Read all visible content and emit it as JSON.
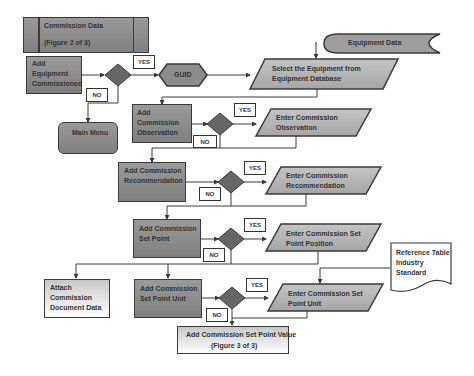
{
  "header": {
    "title": "Commission Data",
    "subtitle": "(Figure 2 of 3)"
  },
  "nodes": {
    "add_equipment": "Add\nEquipment\nCommissioned",
    "guid": "GUID",
    "equipment_data": "Equipment Data",
    "select_equipment": "Select the Equipment from\nEquipment Database",
    "main_menu": "Main Menu",
    "add_observation": "Add\nCommission\nObservation",
    "enter_observation": "Enter Commission\nObservation",
    "add_recommendation": "Add Commission\nRecommendation",
    "enter_recommendation": "Enter Commission\nRecommendation",
    "add_set_point": "Add Commission\nSet Point",
    "enter_set_point": "Enter Commission Set\nPoint Position",
    "reference_table": "Reference Table\nIndustry\nStandard",
    "attach_document": "Attach\nCommission\nDocument Data",
    "add_set_point_unit": "Add Commission\nSet Point Unit",
    "enter_set_point_unit": "Enter Commission Set\nPoint Unit",
    "footer_title": "Add Commission Set Point Value",
    "footer_subtitle": "(Figure 3 of 3)"
  },
  "labels": {
    "yes": "YES",
    "no": "NO"
  },
  "colors": {
    "box_fill": "#8c8c8c",
    "diamond_fill": "#666666",
    "parallelogram_fill": "#b3b3b3",
    "line": "#3a3a3a"
  }
}
